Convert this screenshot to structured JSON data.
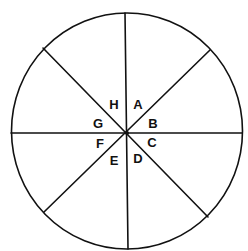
{
  "diagram": {
    "sector_count": 8,
    "line_color": "#111111",
    "background": "#ffffff",
    "labels": [
      {
        "id": "A",
        "text": "A"
      },
      {
        "id": "B",
        "text": "B"
      },
      {
        "id": "C",
        "text": "C"
      },
      {
        "id": "D",
        "text": "D"
      },
      {
        "id": "E",
        "text": "E"
      },
      {
        "id": "F",
        "text": "F"
      },
      {
        "id": "G",
        "text": "G"
      },
      {
        "id": "H",
        "text": "H"
      }
    ]
  }
}
